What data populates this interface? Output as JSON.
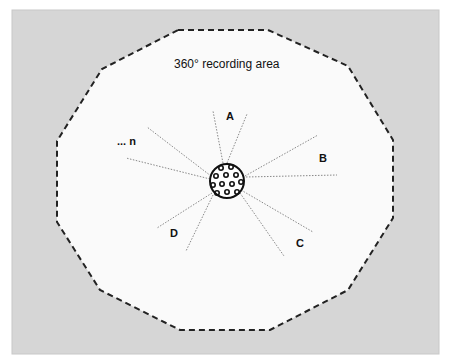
{
  "diagram": {
    "title": "360° recording area",
    "colors": {
      "outer_background": "#d6d6d6",
      "area_fill": "#fafafa",
      "boundary_stroke": "#222222",
      "ray_stroke": "#777777",
      "microphone_fill": "#ffffff",
      "microphone_stroke": "#111111"
    },
    "labels": {
      "a": "A",
      "b": "B",
      "c": "C",
      "d": "D",
      "n": "... n"
    },
    "microphone": {
      "name": "spherical-microphone-array",
      "cx": 227,
      "cy": 181,
      "r": 17
    }
  }
}
